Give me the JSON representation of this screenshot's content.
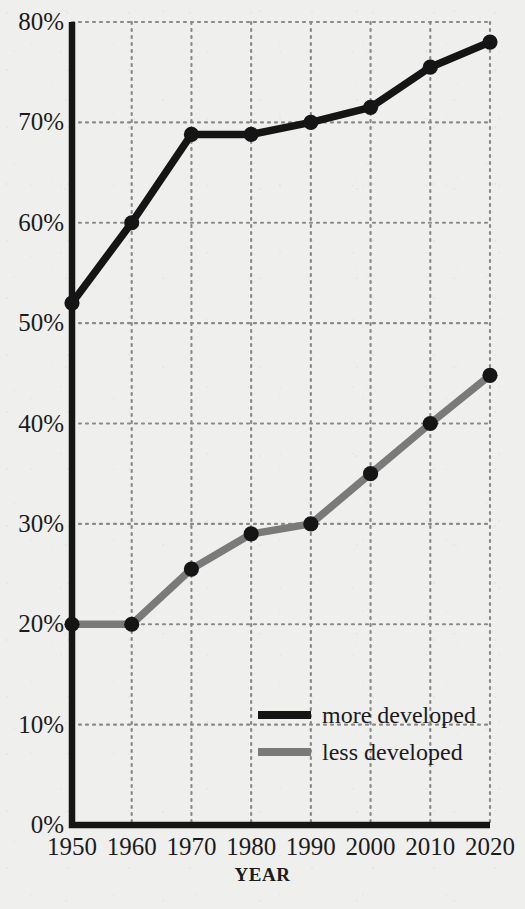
{
  "chart_data": {
    "type": "line",
    "title": "",
    "subtitle": "",
    "xlabel": "YEAR",
    "ylabel": "",
    "x": [
      1950,
      1960,
      1970,
      1980,
      1990,
      2000,
      2010,
      2020
    ],
    "categories": [
      "1950",
      "1960",
      "1970",
      "1980",
      "1990",
      "2000",
      "2010",
      "2020"
    ],
    "xlim": [
      1950,
      2020
    ],
    "ylim": [
      0,
      80
    ],
    "ytick_values": [
      0,
      10,
      20,
      30,
      40,
      50,
      60,
      70,
      80
    ],
    "ytick_labels": [
      "0%",
      "10%",
      "20%",
      "30%",
      "40%",
      "50%",
      "60%",
      "70%",
      "80%"
    ],
    "xtick_labels": [
      "1950",
      "1960",
      "1970",
      "1980",
      "1990",
      "2000",
      "2010",
      "2020"
    ],
    "grid": true,
    "grid_style": "dotted",
    "legend_position": "bottom-right",
    "markers": true,
    "series": [
      {
        "name": "more developed",
        "color": "#151515",
        "values": [
          52,
          60,
          68.8,
          68.8,
          70,
          71.5,
          75.5,
          78
        ]
      },
      {
        "name": "less developed",
        "color": "#7a7a7a",
        "values": [
          20,
          20,
          25.5,
          29,
          30,
          35,
          40,
          44.8
        ]
      }
    ]
  },
  "legend": {
    "items": [
      {
        "label": "more developed",
        "color": "#151515"
      },
      {
        "label": "less developed",
        "color": "#7a7a7a"
      }
    ]
  },
  "axes": {
    "x_title": "YEAR",
    "axis_color": "#151515",
    "grid_color": "#8a8a8a"
  },
  "colors": {
    "background": "#efefed",
    "text": "#1c1c1c",
    "more_developed": "#151515",
    "less_developed": "#7a7a7a"
  }
}
